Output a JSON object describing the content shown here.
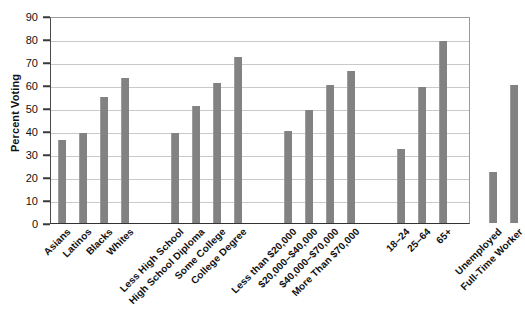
{
  "chart_data": {
    "type": "bar",
    "title": "",
    "subtitle": "",
    "xlabel": "",
    "ylabel": "Percent Voting",
    "ylim": [
      0,
      90
    ],
    "ytick_step": 10,
    "yticks": [
      "90",
      "80",
      "70",
      "60",
      "50",
      "40",
      "30",
      "20",
      "10",
      "0"
    ],
    "grid": true,
    "legend": "none",
    "bar_color": "#828282",
    "categories": [
      "Asians",
      "Latinos",
      "Blacks",
      "Whites",
      "Less High School",
      "High School Diploma",
      "Some College",
      "College Degree",
      "Less than $20,000",
      "$20,000–$40,000",
      "$40,000–$70,000",
      "More Than $70,000",
      "18–24",
      "25–64",
      "65+",
      "Unemployed",
      "Full-Time Worker"
    ],
    "values": [
      36,
      39,
      55,
      63,
      39,
      51,
      61,
      72,
      40,
      49,
      60,
      66,
      32,
      59,
      79,
      22,
      60
    ],
    "groups": [
      {
        "name": "Race and Ethnicity",
        "categories": [
          "Asians",
          "Latinos",
          "Blacks",
          "Whites"
        ],
        "values": [
          36,
          39,
          55,
          63
        ]
      },
      {
        "name": "Education",
        "categories": [
          "Less High School",
          "High School Diploma",
          "Some College",
          "College Degree"
        ],
        "values": [
          39,
          51,
          61,
          72
        ]
      },
      {
        "name": "Income",
        "categories": [
          "Less than $20,000",
          "$20,000–$40,000",
          "$40,000–$70,000",
          "More Than $70,000"
        ],
        "values": [
          40,
          49,
          60,
          66
        ]
      },
      {
        "name": "Age",
        "categories": [
          "18–24",
          "25–64",
          "65+"
        ],
        "values": [
          32,
          59,
          79
        ]
      },
      {
        "name": "Employment",
        "categories": [
          "Unemployed",
          "Full-Time Worker"
        ],
        "values": [
          22,
          60
        ]
      }
    ]
  },
  "axis": {
    "y_title": "Percent Voting",
    "y_ticks": [
      "90",
      "80",
      "70",
      "60",
      "50",
      "40",
      "30",
      "20",
      "10",
      "0"
    ]
  }
}
